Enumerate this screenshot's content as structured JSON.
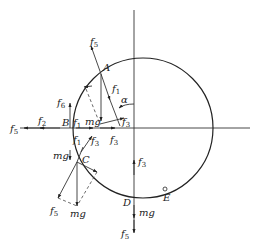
{
  "diagram": {
    "points": [
      {
        "id": "A",
        "label": "A"
      },
      {
        "id": "B",
        "label": "B"
      },
      {
        "id": "C",
        "label": "C"
      },
      {
        "id": "D",
        "label": "D"
      },
      {
        "id": "E",
        "label": "E"
      }
    ],
    "angle_label": "α",
    "forces": {
      "A": [
        {
          "base": "f",
          "sub": "5"
        },
        {
          "base": "f",
          "sub": "1"
        },
        {
          "base": "f",
          "sub": "3"
        },
        {
          "base": "mg",
          "sub": ""
        }
      ],
      "B": [
        {
          "base": "f",
          "sub": "6"
        },
        {
          "base": "f",
          "sub": "2"
        },
        {
          "base": "f",
          "sub": "5"
        },
        {
          "base": "f",
          "sub": "1"
        },
        {
          "base": "mg",
          "sub": ""
        },
        {
          "base": "f",
          "sub": "3"
        }
      ],
      "C": [
        {
          "base": "f",
          "sub": "1"
        },
        {
          "base": "f",
          "sub": "3"
        },
        {
          "base": "mg",
          "sub": ""
        },
        {
          "base": "f",
          "sub": "5"
        },
        {
          "base": "mg",
          "sub": ""
        }
      ],
      "D": [
        {
          "base": "f",
          "sub": "3"
        },
        {
          "base": "mg",
          "sub": ""
        },
        {
          "base": "f",
          "sub": "5"
        }
      ]
    }
  }
}
